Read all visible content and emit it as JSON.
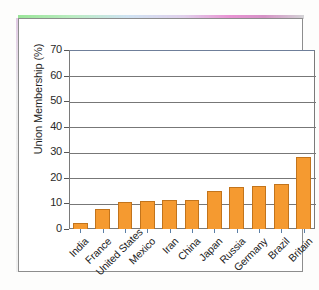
{
  "figure": {
    "kind": "scanned-bar-chart",
    "frame_border_color": "#8d8d8d",
    "background_color": "#ffffff"
  },
  "chart_data": {
    "type": "bar",
    "title": "",
    "xlabel": "",
    "ylabel": "Union Membership (%)",
    "categories": [
      "India",
      "France",
      "United States",
      "Mexico",
      "Iran",
      "China",
      "Japan",
      "Russia",
      "Germany",
      "Brazil",
      "Britain"
    ],
    "values": [
      2.2,
      7.8,
      10.5,
      11.0,
      11.5,
      11.5,
      15.0,
      16.5,
      17.0,
      17.5,
      28.0
    ],
    "ylim": [
      0,
      70
    ],
    "ytick_labels": [
      "0",
      "10",
      "20",
      "30",
      "40",
      "50",
      "60",
      "70"
    ],
    "ytick_values": [
      0,
      10,
      20,
      30,
      40,
      50,
      60,
      70
    ],
    "grid": true,
    "legend": false,
    "bar_color": "#f59a30",
    "bar_edge_color": "#c2741c"
  }
}
